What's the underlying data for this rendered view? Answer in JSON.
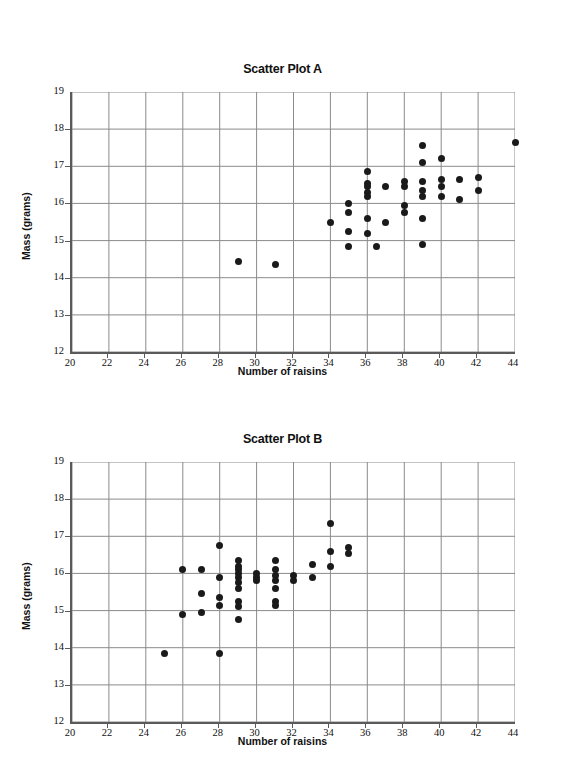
{
  "page": {
    "background": "#ffffff",
    "point_color": "#1a1a1a",
    "grid_color": "#8a8a8a",
    "axis_color": "#5a5a5a"
  },
  "charts": [
    {
      "id": "plot-a",
      "title": "Scatter Plot A",
      "xlabel": "Number of raisins",
      "ylabel": "Mass (grams)"
    },
    {
      "id": "plot-b",
      "title": "Scatter Plot B",
      "xlabel": "Number of raisins",
      "ylabel": "Mass (grams)"
    }
  ],
  "axis": {
    "x_ticks": [
      20,
      22,
      24,
      26,
      28,
      30,
      32,
      34,
      36,
      38,
      40,
      42,
      44
    ],
    "y_ticks": [
      12,
      13,
      14,
      15,
      16,
      17,
      18,
      19
    ],
    "xlim": [
      20,
      44
    ],
    "ylim": [
      12,
      19
    ]
  },
  "chart_data": [
    {
      "type": "scatter",
      "id": "plot-a",
      "title": "Scatter Plot A",
      "xlabel": "Number of raisins",
      "ylabel": "Mass (grams)",
      "xlim": [
        20,
        44
      ],
      "ylim": [
        12,
        19
      ],
      "xticks": [
        20,
        22,
        24,
        26,
        28,
        30,
        32,
        34,
        36,
        38,
        40,
        42,
        44
      ],
      "yticks": [
        12,
        13,
        14,
        15,
        16,
        17,
        18,
        19
      ],
      "grid": true,
      "legend": "none",
      "points": [
        [
          29.0,
          14.45
        ],
        [
          31.0,
          14.35
        ],
        [
          34.0,
          15.5
        ],
        [
          35.0,
          16.0
        ],
        [
          35.0,
          15.75
        ],
        [
          35.0,
          15.25
        ],
        [
          35.0,
          14.85
        ],
        [
          36.0,
          16.85
        ],
        [
          36.0,
          16.55
        ],
        [
          36.0,
          16.45
        ],
        [
          36.0,
          16.3
        ],
        [
          36.0,
          16.2
        ],
        [
          36.0,
          15.6
        ],
        [
          36.0,
          15.2
        ],
        [
          36.5,
          14.85
        ],
        [
          37.0,
          16.45
        ],
        [
          37.0,
          15.5
        ],
        [
          38.0,
          16.6
        ],
        [
          38.0,
          16.45
        ],
        [
          38.0,
          15.95
        ],
        [
          38.0,
          15.75
        ],
        [
          39.0,
          17.55
        ],
        [
          39.0,
          17.1
        ],
        [
          39.0,
          16.6
        ],
        [
          39.0,
          16.35
        ],
        [
          39.0,
          16.2
        ],
        [
          39.0,
          15.6
        ],
        [
          39.0,
          14.9
        ],
        [
          40.0,
          17.2
        ],
        [
          40.0,
          16.65
        ],
        [
          40.0,
          16.45
        ],
        [
          40.0,
          16.2
        ],
        [
          41.0,
          16.65
        ],
        [
          41.0,
          16.1
        ],
        [
          42.0,
          16.7
        ],
        [
          42.0,
          16.35
        ],
        [
          44.0,
          17.65
        ]
      ]
    },
    {
      "type": "scatter",
      "id": "plot-b",
      "title": "Scatter Plot B",
      "xlabel": "Number of raisins",
      "ylabel": "Mass (grams)",
      "xlim": [
        20,
        44
      ],
      "ylim": [
        12,
        19
      ],
      "xticks": [
        20,
        22,
        24,
        26,
        28,
        30,
        32,
        34,
        36,
        38,
        40,
        42,
        44
      ],
      "yticks": [
        12,
        13,
        14,
        15,
        16,
        17,
        18,
        19
      ],
      "grid": true,
      "legend": "none",
      "points": [
        [
          25.0,
          13.85
        ],
        [
          26.0,
          16.1
        ],
        [
          26.0,
          14.9
        ],
        [
          27.0,
          16.1
        ],
        [
          27.0,
          15.45
        ],
        [
          27.0,
          14.95
        ],
        [
          28.0,
          16.75
        ],
        [
          28.0,
          15.9
        ],
        [
          28.0,
          15.35
        ],
        [
          28.0,
          15.15
        ],
        [
          28.0,
          13.85
        ],
        [
          29.0,
          16.35
        ],
        [
          29.0,
          16.2
        ],
        [
          29.0,
          16.1
        ],
        [
          29.0,
          16.0
        ],
        [
          29.0,
          15.9
        ],
        [
          29.0,
          15.75
        ],
        [
          29.0,
          15.6
        ],
        [
          29.0,
          15.25
        ],
        [
          29.0,
          15.1
        ],
        [
          29.0,
          14.75
        ],
        [
          30.0,
          16.0
        ],
        [
          30.0,
          15.9
        ],
        [
          30.0,
          15.8
        ],
        [
          31.0,
          16.35
        ],
        [
          31.0,
          16.1
        ],
        [
          31.0,
          15.95
        ],
        [
          31.0,
          15.8
        ],
        [
          31.0,
          15.6
        ],
        [
          31.0,
          15.25
        ],
        [
          31.0,
          15.15
        ],
        [
          32.0,
          15.95
        ],
        [
          32.0,
          15.8
        ],
        [
          33.0,
          16.25
        ],
        [
          33.0,
          15.9
        ],
        [
          34.0,
          17.35
        ],
        [
          34.0,
          16.6
        ],
        [
          34.0,
          16.2
        ],
        [
          35.0,
          16.7
        ],
        [
          35.0,
          16.55
        ]
      ]
    }
  ]
}
